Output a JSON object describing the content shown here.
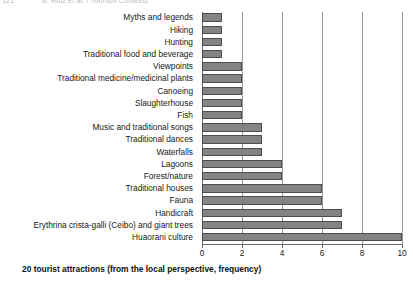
{
  "page_header": {
    "folio": "122",
    "running_title": "S. Ruiz et al. / Tourism Contexts"
  },
  "caption": "20 tourist attractions (from the local perspective, frequency)",
  "colors": {
    "bar_fill": "#848484",
    "bar_stroke": "#4d4d4d",
    "gridline": "#9a9a9a",
    "axis": "#6a6a6a",
    "text": "#181818",
    "background": "#ffffff"
  },
  "chart_data": {
    "type": "bar",
    "orientation": "horizontal",
    "title": "",
    "xlabel": "",
    "ylabel": "",
    "xlim": [
      0,
      10
    ],
    "ylim": null,
    "grid": true,
    "legend": null,
    "xticks": [
      0,
      2,
      4,
      6,
      8,
      10
    ],
    "categories": [
      "Myths and legends",
      "Hiking",
      "Hunting",
      "Traditional food and beverage",
      "Viewpoints",
      "Traditional medicine/medicinal plants",
      "Canoeing",
      "Slaughterhouse",
      "Fish",
      "Music and traditional songs",
      "Traditional dances",
      "Waterfalls",
      "Lagoons",
      "Forest/nature",
      "Traditional houses",
      "Fauna",
      "Handicraft",
      "Erythrina crista-galli (Ceibo) and giant trees",
      "Huaorani culture"
    ],
    "values": [
      1,
      1,
      1,
      1,
      2,
      2,
      2,
      2,
      2,
      3,
      3,
      3,
      4,
      4,
      6,
      6,
      7,
      7,
      10
    ]
  }
}
